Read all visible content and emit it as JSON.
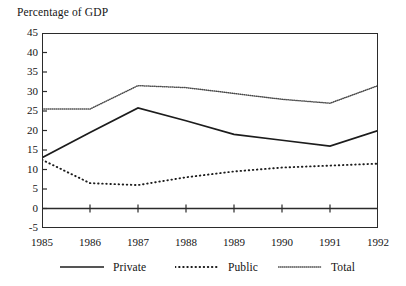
{
  "chart_data": {
    "type": "line",
    "title": "Percentage of GDP",
    "xlabel": "",
    "ylabel": "Percentage of GDP",
    "x": [
      1985,
      1986,
      1987,
      1988,
      1989,
      1990,
      1991,
      1992
    ],
    "categories": [
      "1985",
      "1986",
      "1987",
      "1988",
      "1989",
      "1990",
      "1991",
      "1992"
    ],
    "ylim": [
      -5,
      45
    ],
    "yticks": [
      45,
      40,
      35,
      30,
      25,
      20,
      15,
      10,
      5,
      0,
      -5
    ],
    "ytick_labels": [
      "45",
      "40",
      "35",
      "30",
      "25",
      "20",
      "15",
      "10",
      "5",
      "0",
      "-5"
    ],
    "xlim": [
      1985,
      1992
    ],
    "grid": false,
    "legend_position": "bottom",
    "series": [
      {
        "name": "Private",
        "style": "solid",
        "color": "#1c1c1c",
        "values": [
          13,
          19.5,
          25.8,
          22.5,
          19,
          17.5,
          16,
          20
        ]
      },
      {
        "name": "Public",
        "style": "dotted",
        "color": "#1c1c1c",
        "values": [
          12.5,
          6.5,
          6,
          8,
          9.5,
          10.5,
          11,
          11.5
        ]
      },
      {
        "name": "Total",
        "style": "fine-dotted",
        "color": "#4a4a4a",
        "values": [
          25.5,
          25.5,
          31.5,
          31,
          29.5,
          28,
          27,
          31.5
        ]
      }
    ]
  },
  "legend": {
    "items": [
      {
        "label": "Private"
      },
      {
        "label": "Public"
      },
      {
        "label": "Total"
      }
    ]
  }
}
